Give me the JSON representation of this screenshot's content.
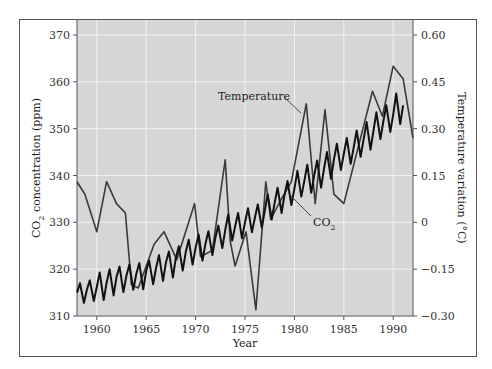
{
  "chart_data": {
    "type": "line",
    "title": "",
    "xlabel": "Year",
    "ylabel_left": "CO2 concentration (ppm)",
    "ylabel_right": "Temperature variation (°C)",
    "xlim": [
      1958,
      1992
    ],
    "ylim_left": [
      310,
      370
    ],
    "ylim_right": [
      -0.3,
      0.6
    ],
    "x_ticks": [
      "1960",
      "1965",
      "1970",
      "1975",
      "1980",
      "1985",
      "1990"
    ],
    "x_tick_values": [
      1960,
      1965,
      1970,
      1975,
      1980,
      1985,
      1990
    ],
    "y_ticks_left": [
      "310",
      "320",
      "330",
      "340",
      "350",
      "360",
      "370"
    ],
    "y_tick_values_left": [
      310,
      320,
      330,
      340,
      350,
      360,
      370
    ],
    "y_ticks_right": [
      "−0.30",
      "−0.15",
      "0",
      "0.15",
      "0.30",
      "0.45",
      "0.60"
    ],
    "y_tick_values_right": [
      -0.3,
      -0.15,
      0,
      0.15,
      0.3,
      0.45,
      0.6
    ],
    "grid": true,
    "background": "#d6d6d6",
    "annotations": [
      {
        "text": "Temperature",
        "series": "Temperature"
      },
      {
        "text": "CO",
        "subscript": "2",
        "series": "CO2"
      }
    ],
    "series": [
      {
        "name": "CO2",
        "axis": "left",
        "color": "#1a1a1a",
        "x": [
          1958.0,
          1958.3,
          1958.7,
          1959.0,
          1959.3,
          1959.7,
          1960.0,
          1960.3,
          1960.7,
          1961.0,
          1961.3,
          1961.7,
          1962.0,
          1962.3,
          1962.7,
          1963.0,
          1963.3,
          1963.7,
          1964.0,
          1964.3,
          1964.7,
          1965.0,
          1965.3,
          1965.7,
          1966.0,
          1966.3,
          1966.7,
          1967.0,
          1967.3,
          1967.7,
          1968.0,
          1968.3,
          1968.7,
          1969.0,
          1969.3,
          1969.7,
          1970.0,
          1970.3,
          1970.7,
          1971.0,
          1971.3,
          1971.7,
          1972.0,
          1972.3,
          1972.7,
          1973.0,
          1973.3,
          1973.7,
          1974.0,
          1974.3,
          1974.7,
          1975.0,
          1975.3,
          1975.7,
          1976.0,
          1976.3,
          1976.7,
          1977.0,
          1977.3,
          1977.7,
          1978.0,
          1978.3,
          1978.7,
          1979.0,
          1979.3,
          1979.7,
          1980.0,
          1980.3,
          1980.7,
          1981.0,
          1981.3,
          1981.7,
          1982.0,
          1982.3,
          1982.7,
          1983.0,
          1983.3,
          1983.7,
          1984.0,
          1984.3,
          1984.7,
          1985.0,
          1985.3,
          1985.7,
          1986.0,
          1986.3,
          1986.7,
          1987.0,
          1987.3,
          1987.7,
          1988.0,
          1988.3,
          1988.7,
          1989.0,
          1989.3,
          1989.7,
          1990.0,
          1990.3,
          1990.7,
          1991.0
        ],
        "values": [
          315.0,
          317.0,
          312.8,
          315.6,
          317.6,
          313.2,
          316.2,
          319.3,
          313.4,
          317.1,
          320.0,
          314.4,
          318.3,
          320.6,
          315.1,
          318.6,
          321.0,
          315.6,
          319.0,
          321.3,
          315.7,
          319.6,
          321.8,
          316.8,
          320.3,
          323.0,
          317.5,
          321.4,
          323.8,
          318.2,
          322.4,
          324.9,
          319.7,
          323.6,
          326.3,
          321.0,
          324.6,
          327.4,
          321.8,
          325.5,
          328.1,
          323.0,
          326.7,
          329.3,
          324.5,
          328.3,
          331.7,
          326.1,
          329.1,
          332.0,
          326.6,
          330.0,
          333.0,
          327.9,
          331.0,
          333.8,
          328.9,
          332.5,
          336.0,
          330.6,
          334.1,
          337.4,
          332.0,
          335.8,
          338.8,
          333.7,
          337.2,
          341.0,
          335.5,
          338.8,
          342.3,
          336.3,
          340.0,
          343.2,
          337.4,
          341.6,
          345.0,
          339.3,
          343.4,
          346.8,
          341.2,
          344.6,
          348.0,
          342.5,
          346.0,
          349.6,
          344.0,
          347.7,
          351.4,
          345.5,
          349.6,
          353.5,
          347.8,
          351.6,
          355.0,
          349.3,
          353.0,
          357.5,
          351.0,
          355.0
        ]
      },
      {
        "name": "Temperature",
        "axis": "right",
        "color": "#3a3a3a",
        "x": [
          1958.0,
          1958.8,
          1960.0,
          1961.0,
          1962.0,
          1962.9,
          1963.5,
          1964.2,
          1965.0,
          1965.8,
          1966.8,
          1968.1,
          1969.9,
          1970.5,
          1971.7,
          1973.0,
          1973.5,
          1974.0,
          1975.1,
          1976.1,
          1977.1,
          1977.6,
          1978.6,
          1979.7,
          1981.2,
          1982.1,
          1983.1,
          1984.0,
          1985.0,
          1987.9,
          1988.9,
          1990.0,
          1991.0,
          1992.0
        ],
        "values": [
          0.13,
          0.09,
          -0.03,
          0.13,
          0.06,
          0.03,
          -0.2,
          -0.21,
          -0.14,
          -0.07,
          -0.03,
          -0.12,
          0.06,
          -0.11,
          -0.09,
          0.2,
          -0.06,
          -0.14,
          -0.03,
          -0.28,
          0.13,
          0.01,
          0.07,
          0.13,
          0.38,
          0.06,
          0.36,
          0.09,
          0.06,
          0.42,
          0.34,
          0.5,
          0.46,
          0.27
        ]
      }
    ]
  }
}
